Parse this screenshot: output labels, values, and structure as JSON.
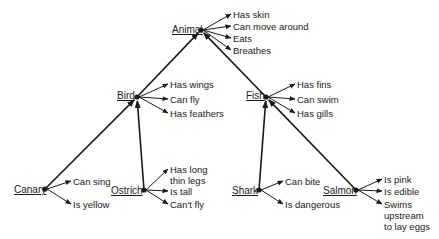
{
  "diagram": {
    "nodes": [
      {
        "id": "animal",
        "label": "Animal",
        "x": 201,
        "y": 30,
        "label_x": 172,
        "label_y": 30,
        "properties": [
          {
            "text": "Has skin",
            "x": 233,
            "y": 14
          },
          {
            "text": "Can move around",
            "x": 233,
            "y": 26
          },
          {
            "text": "Eats",
            "x": 233,
            "y": 38
          },
          {
            "text": "Breathes",
            "x": 233,
            "y": 50
          }
        ]
      },
      {
        "id": "bird",
        "label": "Bird",
        "x": 137,
        "y": 97,
        "label_x": 117,
        "label_y": 96,
        "properties": [
          {
            "text": "Has wings",
            "x": 170,
            "y": 84
          },
          {
            "text": "Can fly",
            "x": 170,
            "y": 99
          },
          {
            "text": "Has feathers",
            "x": 170,
            "y": 113
          }
        ]
      },
      {
        "id": "fish",
        "label": "Fish",
        "x": 266,
        "y": 97,
        "label_x": 246,
        "label_y": 96,
        "properties": [
          {
            "text": "Has fins",
            "x": 297,
            "y": 84
          },
          {
            "text": "Can swim",
            "x": 297,
            "y": 99
          },
          {
            "text": "Has gills",
            "x": 297,
            "y": 113
          }
        ]
      },
      {
        "id": "canary",
        "label": "Canary",
        "x": 45,
        "y": 189,
        "label_x": 14,
        "label_y": 190,
        "properties": [
          {
            "text": "Can sing",
            "x": 73,
            "y": 181
          },
          {
            "text": "Is yellow",
            "x": 73,
            "y": 204
          }
        ]
      },
      {
        "id": "ostrich",
        "label": "Ostrich",
        "x": 144,
        "y": 190,
        "label_x": 111,
        "label_y": 191,
        "properties": [
          {
            "text": "Has long",
            "x": 170,
            "y": 169
          },
          {
            "text": "thin legs",
            "x": 170,
            "y": 180,
            "no_arrow": true
          },
          {
            "text": "Is tall",
            "x": 170,
            "y": 191
          },
          {
            "text": "Can't fly",
            "x": 170,
            "y": 204
          }
        ]
      },
      {
        "id": "shark",
        "label": "Shark",
        "x": 259,
        "y": 190,
        "label_x": 232,
        "label_y": 191,
        "properties": [
          {
            "text": "Can bite",
            "x": 285,
            "y": 181
          },
          {
            "text": "Is dangerous",
            "x": 285,
            "y": 204
          }
        ]
      },
      {
        "id": "salmon",
        "label": "Salmon",
        "x": 356,
        "y": 190,
        "label_x": 323,
        "label_y": 191,
        "properties": [
          {
            "text": "Is pink",
            "x": 384,
            "y": 179
          },
          {
            "text": "Is edible",
            "x": 384,
            "y": 191
          },
          {
            "text": "Swims",
            "x": 384,
            "y": 204
          },
          {
            "text": "upstream",
            "x": 384,
            "y": 215,
            "no_arrow": true
          },
          {
            "text": "to lay eggs",
            "x": 384,
            "y": 226,
            "no_arrow": true
          }
        ]
      }
    ],
    "edges": [
      {
        "from": "canary",
        "to": "bird"
      },
      {
        "from": "ostrich",
        "to": "bird"
      },
      {
        "from": "shark",
        "to": "fish"
      },
      {
        "from": "salmon",
        "to": "fish"
      },
      {
        "from": "bird",
        "to": "animal"
      },
      {
        "from": "fish",
        "to": "animal"
      }
    ],
    "colors": {
      "ink": "#1a1a1a",
      "background": "#ffffff"
    }
  }
}
